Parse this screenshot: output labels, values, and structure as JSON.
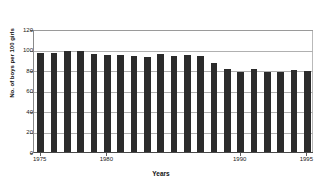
{
  "chart_data": {
    "type": "bar",
    "title": "",
    "xlabel": "Years",
    "ylabel": "No. of boys per 100 girls",
    "categories": [
      "1975",
      "1976",
      "1977",
      "1978",
      "1979",
      "1980",
      "1981",
      "1982",
      "1983",
      "1984",
      "1985",
      "1986",
      "1987",
      "1988",
      "1989",
      "1990",
      "1991",
      "1992",
      "1993",
      "1994",
      "1995"
    ],
    "values": [
      97,
      97,
      99,
      99,
      96,
      95,
      95,
      94,
      93,
      96,
      94,
      95,
      94,
      87,
      81,
      78,
      81,
      78,
      78,
      80,
      79
    ],
    "ylim": [
      0,
      120
    ],
    "yticks": [
      0,
      20,
      40,
      60,
      80,
      100,
      120
    ],
    "ytick_labels": [
      "0",
      "20",
      "40",
      "60",
      "80",
      "100",
      "120"
    ],
    "xtick_labels": [
      "1975",
      "1980",
      "1990",
      "1995"
    ],
    "xtick_categories": [
      "1975",
      "1980",
      "1990",
      "1995"
    ],
    "grid": true,
    "legend": "none",
    "bar_color": "#2b2b2b",
    "grid_color": "#b0b0b0",
    "axis_color": "#4a4a4a",
    "background": "#ffffff"
  }
}
